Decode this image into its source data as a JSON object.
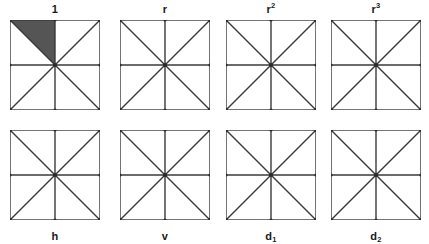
{
  "figure": {
    "rows": 2,
    "columns": 4,
    "background_color": "#ffffff",
    "line_color": "#3a3a3a",
    "marker_color": "#2b2b2b",
    "shade_color": "#555555"
  },
  "cells": [
    {
      "id": "identity",
      "label_text": "1",
      "label_base": "1",
      "label_script": "",
      "label_script_kind": "none",
      "label_position": "top",
      "row": 0,
      "column": 0,
      "shaded": true,
      "shaded_sector": "upper-left-upper",
      "shaded_sector_points": "0,0 45,0 45,45"
    },
    {
      "id": "rotation-90",
      "label_text": "r",
      "label_base": "r",
      "label_script": "",
      "label_script_kind": "none",
      "label_position": "top",
      "row": 0,
      "column": 1,
      "shaded": false,
      "shaded_sector": "",
      "shaded_sector_points": ""
    },
    {
      "id": "rotation-180",
      "label_text": "r2",
      "label_base": "r",
      "label_script": "2",
      "label_script_kind": "superscript",
      "label_position": "top",
      "row": 0,
      "column": 2,
      "shaded": false,
      "shaded_sector": "",
      "shaded_sector_points": ""
    },
    {
      "id": "rotation-270",
      "label_text": "r3",
      "label_base": "r",
      "label_script": "3",
      "label_script_kind": "superscript",
      "label_position": "top",
      "row": 0,
      "column": 3,
      "shaded": false,
      "shaded_sector": "",
      "shaded_sector_points": ""
    },
    {
      "id": "reflection-horizontal",
      "label_text": "h",
      "label_base": "h",
      "label_script": "",
      "label_script_kind": "none",
      "label_position": "bottom",
      "row": 1,
      "column": 0,
      "shaded": false,
      "shaded_sector": "",
      "shaded_sector_points": ""
    },
    {
      "id": "reflection-vertical",
      "label_text": "v",
      "label_base": "v",
      "label_script": "",
      "label_script_kind": "none",
      "label_position": "bottom",
      "row": 1,
      "column": 1,
      "shaded": false,
      "shaded_sector": "",
      "shaded_sector_points": ""
    },
    {
      "id": "reflection-diagonal-1",
      "label_text": "d1",
      "label_base": "d",
      "label_script": "1",
      "label_script_kind": "subscript",
      "label_position": "bottom",
      "row": 1,
      "column": 2,
      "shaded": false,
      "shaded_sector": "",
      "shaded_sector_points": ""
    },
    {
      "id": "reflection-diagonal-2",
      "label_text": "d2",
      "label_base": "d",
      "label_script": "2",
      "label_script_kind": "subscript",
      "label_position": "bottom",
      "row": 1,
      "column": 3,
      "shaded": false,
      "shaded_sector": "",
      "shaded_sector_points": ""
    }
  ]
}
